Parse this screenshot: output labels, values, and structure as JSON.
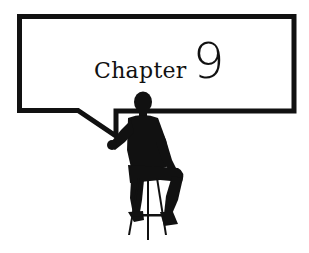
{
  "heading": {
    "word": "Chapter",
    "number": "9"
  },
  "colors": {
    "ink": "#111111",
    "background": "#ffffff"
  },
  "illustration": {
    "subject": "silhouette of a seated man on a bar stool pointing at a speech-balloon sign"
  }
}
